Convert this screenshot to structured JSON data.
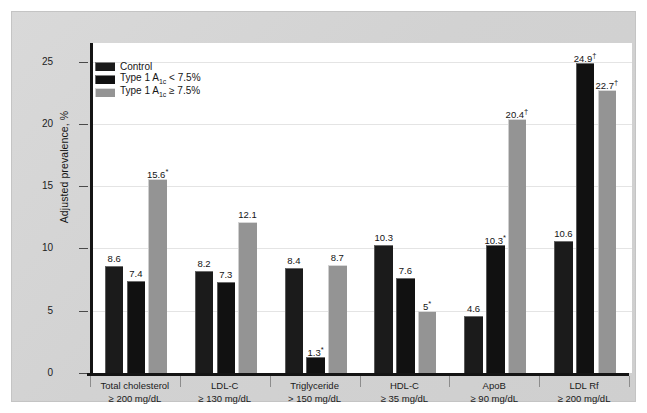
{
  "chart_data": {
    "type": "bar",
    "title": "",
    "xlabel": "",
    "ylabel": "Adjusted prevalence, %",
    "ylim": [
      0,
      26.5
    ],
    "yticks": [
      0,
      5,
      10,
      15,
      20,
      25
    ],
    "grid": true,
    "legend_position": "top-left",
    "categories": [
      "Total cholesterol ≥ 200 mg/dL",
      "LDL-C ≥ 130 mg/dL",
      "Triglyceride > 150 mg/dL",
      "HDL-C ≥ 35 mg/dL",
      "ApoB ≥ 90 mg/dL",
      "LDL Rf ≥ 200 mg/dL"
    ],
    "category_lines": [
      {
        "line1": "Total cholesterol",
        "line2": "≥ 200 mg/dL"
      },
      {
        "line1": "LDL-C",
        "line2": "≥ 130 mg/dL"
      },
      {
        "line1": "Triglyceride",
        "line2": "> 150 mg/dL"
      },
      {
        "line1": "HDL-C",
        "line2": "≥ 35 mg/dL"
      },
      {
        "line1": "ApoB",
        "line2": "≥ 90 mg/dL"
      },
      {
        "line1": "LDL Rf",
        "line2": "≥ 200 mg/dL"
      }
    ],
    "series": [
      {
        "name": "Control",
        "color": "#1b1b1b",
        "values": [
          8.6,
          8.2,
          8.4,
          10.3,
          4.6,
          10.6
        ],
        "labels": [
          "8.6",
          "8.2",
          "8.4",
          "10.3",
          "4.6",
          "10.6"
        ],
        "marks": [
          "",
          "",
          "",
          "",
          "",
          ""
        ]
      },
      {
        "name": "Type 1 A1c < 7.5%",
        "color": "#111111",
        "values": [
          7.4,
          7.3,
          1.3,
          7.6,
          10.3,
          24.9
        ],
        "labels": [
          "7.4",
          "7.3",
          "1.3",
          "7.6",
          "10.3",
          "24.9"
        ],
        "marks": [
          "",
          "",
          "*",
          "",
          "*",
          "†"
        ]
      },
      {
        "name": "Type 1 A1c ≥ 7.5%",
        "color": "#949494",
        "values": [
          15.6,
          12.1,
          8.7,
          5.0,
          20.4,
          22.7
        ],
        "labels": [
          "15.6",
          "12.1",
          "8.7",
          "5",
          "20.4",
          "22.7"
        ],
        "marks": [
          "*",
          "",
          "",
          "*",
          "†",
          "†"
        ]
      }
    ]
  },
  "legend": {
    "items": [
      {
        "label_prefix": "Control",
        "label_sub": "",
        "label_suffix": ""
      },
      {
        "label_prefix": "Type 1 A",
        "label_sub": "1c",
        "label_suffix": " < 7.5%"
      },
      {
        "label_prefix": "Type 1 A",
        "label_sub": "1c",
        "label_suffix": " ≥ 7.5%"
      }
    ]
  },
  "axis": {
    "y_title": "Adjusted prevalence, %",
    "y_tick_labels": [
      "25",
      "20",
      "15",
      "10",
      "5",
      "0"
    ]
  },
  "colors": {
    "background": "#d2d2d2",
    "panel": "#ffffff",
    "axis": "#141414",
    "grid": "#e4e4e4",
    "series_control": "#1b1b1b",
    "series_low": "#111111",
    "series_high": "#949494"
  }
}
